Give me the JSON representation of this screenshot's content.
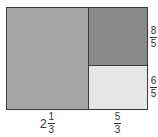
{
  "diagram": {
    "colors": {
      "left_rect": "#a6a6a6",
      "top_right_rect": "#8a8a8a",
      "bottom_right_rect": "#e6e6e6",
      "border": "#3a3a3a"
    },
    "labels": {
      "bottom_left": {
        "whole": "2",
        "numerator": "1",
        "denominator": "3"
      },
      "bottom_right": {
        "numerator": "5",
        "denominator": "3"
      },
      "right_top": {
        "numerator": "8",
        "denominator": "5"
      },
      "right_bottom": {
        "numerator": "6",
        "denominator": "5"
      }
    }
  }
}
